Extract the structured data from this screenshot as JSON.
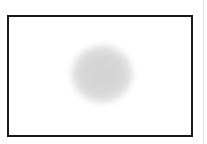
{
  "canvas": {
    "background": "#ffffff"
  },
  "frame": {
    "border_color": "#1a1a1a"
  },
  "blob": {
    "shape": "blurred-circle",
    "color": "#d3d3d3"
  },
  "side_rule": {
    "color": "#e4e4e4"
  }
}
